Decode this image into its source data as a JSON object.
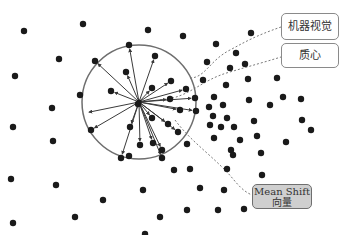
{
  "labels": {
    "machine_vision": "机器视觉",
    "centroid": "质心",
    "mean_shift_line1": "Mean Shift",
    "mean_shift_line2": "向量"
  },
  "colors": {
    "point": "#1a1a1a",
    "circle": "#6e6e6e",
    "vector": "#3a3a3a",
    "dashed": "#7a7a7a",
    "highlight_box": "#cfcfcf"
  },
  "window": {
    "cx": 139,
    "cy": 102,
    "r": 57
  },
  "center": {
    "x": 139,
    "y": 102
  },
  "inside_points": [
    [
      129,
      45
    ],
    [
      95,
      61
    ],
    [
      155,
      56
    ],
    [
      126,
      72
    ],
    [
      111,
      91
    ],
    [
      171,
      81
    ],
    [
      152,
      88
    ],
    [
      186,
      89
    ],
    [
      138,
      104
    ],
    [
      170,
      99
    ],
    [
      195,
      98
    ],
    [
      180,
      110
    ],
    [
      196,
      111
    ],
    [
      130,
      127
    ],
    [
      152,
      118
    ],
    [
      168,
      124
    ],
    [
      91,
      130
    ],
    [
      153,
      143
    ],
    [
      140,
      145
    ],
    [
      121,
      158
    ],
    [
      162,
      158
    ],
    [
      178,
      132
    ],
    [
      162,
      150
    ]
  ],
  "outside_points": [
    [
      24,
      31
    ],
    [
      83,
      24
    ],
    [
      148,
      30
    ],
    [
      183,
      36
    ],
    [
      216,
      44
    ],
    [
      251,
      33
    ],
    [
      236,
      53
    ],
    [
      207,
      62
    ],
    [
      230,
      68
    ],
    [
      245,
      64
    ],
    [
      15,
      76
    ],
    [
      59,
      59
    ],
    [
      52,
      108
    ],
    [
      80,
      95
    ],
    [
      53,
      141
    ],
    [
      13,
      127
    ],
    [
      11,
      179
    ],
    [
      56,
      185
    ],
    [
      75,
      217
    ],
    [
      103,
      200
    ],
    [
      143,
      190
    ],
    [
      160,
      217
    ],
    [
      13,
      223
    ],
    [
      145,
      234
    ],
    [
      210,
      125
    ],
    [
      203,
      80
    ],
    [
      214,
      97
    ],
    [
      226,
      85
    ],
    [
      248,
      79
    ],
    [
      249,
      100
    ],
    [
      277,
      78
    ],
    [
      283,
      97
    ],
    [
      270,
      105
    ],
    [
      301,
      99
    ],
    [
      302,
      120
    ],
    [
      286,
      142
    ],
    [
      311,
      130
    ],
    [
      257,
      136
    ],
    [
      261,
      153
    ],
    [
      209,
      107
    ],
    [
      213,
      116
    ],
    [
      223,
      105
    ],
    [
      227,
      118
    ],
    [
      221,
      127
    ],
    [
      214,
      138
    ],
    [
      234,
      127
    ],
    [
      240,
      140
    ],
    [
      231,
      150
    ],
    [
      254,
      121
    ],
    [
      190,
      169
    ],
    [
      200,
      188
    ],
    [
      227,
      169
    ],
    [
      224,
      190
    ],
    [
      187,
      210
    ],
    [
      218,
      210
    ],
    [
      244,
      209
    ],
    [
      262,
      175
    ],
    [
      233,
      155
    ],
    [
      187,
      144
    ],
    [
      174,
      170
    ],
    [
      129,
      156
    ]
  ],
  "vectors_to": [
    [
      129,
      45
    ],
    [
      95,
      61
    ],
    [
      155,
      56
    ],
    [
      126,
      72
    ],
    [
      111,
      91
    ],
    [
      171,
      81
    ],
    [
      152,
      88
    ],
    [
      186,
      89
    ],
    [
      170,
      99
    ],
    [
      195,
      98
    ],
    [
      180,
      110
    ],
    [
      196,
      111
    ],
    [
      130,
      127
    ],
    [
      152,
      118
    ],
    [
      168,
      124
    ],
    [
      91,
      130
    ],
    [
      153,
      143
    ],
    [
      140,
      145
    ],
    [
      121,
      158
    ],
    [
      162,
      158
    ],
    [
      178,
      132
    ],
    [
      162,
      150
    ],
    [
      85,
      113
    ]
  ]
}
